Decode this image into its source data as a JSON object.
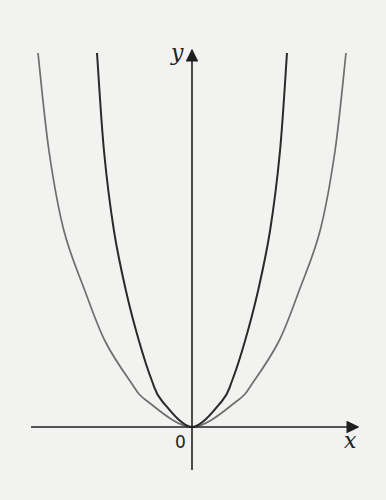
{
  "chart_data": {
    "type": "line",
    "title": "",
    "xlabel": "x",
    "ylabel": "y",
    "origin_label": "0",
    "grid": false,
    "legend": null,
    "pixel_frame": {
      "origin": [
        192,
        427
      ],
      "x_axis": [
        31,
        360
      ],
      "y_axis": [
        470,
        47
      ]
    },
    "series": [
      {
        "name": "outer parabola (wider)",
        "color": "#6e6e6e",
        "points_dx_height": [
          [
            0,
            0
          ],
          [
            45,
            26
          ],
          [
            62,
            46
          ],
          [
            87,
            86
          ],
          [
            107,
            136
          ],
          [
            128,
            196
          ],
          [
            143,
            276
          ],
          [
            154,
            374
          ]
        ]
      },
      {
        "name": "inner parabola (narrower)",
        "color": "#2a2a2a",
        "points_dx_height": [
          [
            0,
            0
          ],
          [
            30,
            26
          ],
          [
            40,
            46
          ],
          [
            53,
            86
          ],
          [
            66,
            136
          ],
          [
            78,
            196
          ],
          [
            88,
            276
          ],
          [
            95,
            374
          ]
        ]
      }
    ]
  },
  "labels": {
    "x_axis": "x",
    "y_axis": "y",
    "origin": "0"
  }
}
